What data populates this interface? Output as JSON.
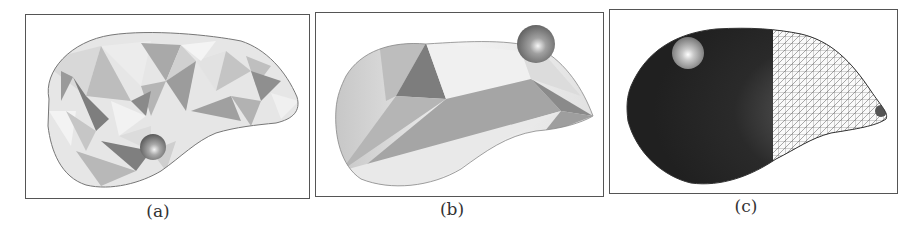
{
  "figure": {
    "panels": [
      {
        "id": "a",
        "caption": "(a)",
        "description": "coarse triangulated liver mesh, flat shading, sphere tool at lower-middle"
      },
      {
        "id": "b",
        "caption": "(b)",
        "description": "very coarse liver mesh with large facets, sphere tool at top-right"
      },
      {
        "id": "c",
        "caption": "(c)",
        "description": "smooth dark-shaded liver, left half solid, right half wireframe mesh, sphere tool at top-left"
      }
    ]
  },
  "colors": {
    "frame": "#555555",
    "background": "#ffffff",
    "facet_light": "#e8e8e8",
    "facet_mid": "#b0b0b0",
    "facet_dark": "#7a7a7a",
    "solid_dark": "#2a2a2a",
    "sphere": "#8a8a8a"
  }
}
